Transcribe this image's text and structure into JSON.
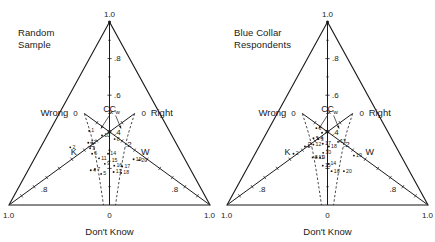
{
  "figure": {
    "type": "ternary-plot-pair",
    "background": "#ffffff",
    "ink": "#1a1a1a"
  },
  "panels": [
    {
      "id": "random-sample",
      "title": "Random\nSample",
      "axes": {
        "apex_label": "1.0",
        "bottom_left_label": "1.0",
        "bottom_right_label": "1.0",
        "bottom_center_label": "0",
        "bottom_axis_name": "Don't Know",
        "left_axis_name": "Wrong",
        "right_axis_name": "Right",
        "left_zero_label": "0",
        "right_zero_label": "0",
        "vertical_ticks": [
          "1.0",
          ".8",
          ".6",
          ".4"
        ],
        "left_inner_tick": ".2",
        "right_inner_tick": ".2",
        "left_outer_tick": ".8",
        "right_outer_tick": ".8"
      },
      "region_labels": [
        {
          "text": "K",
          "x": 0.255,
          "y": 0.725
        },
        {
          "text": "W",
          "x": 0.745,
          "y": 0.725
        }
      ],
      "boundary_labels": [
        {
          "text": "C",
          "sub": "k"
        },
        {
          "text": "C",
          "sub": "w"
        }
      ],
      "points": [
        {
          "id": "1",
          "x": 0.33,
          "y": 0.595
        },
        {
          "id": "2",
          "x": 0.215,
          "y": 0.685
        },
        {
          "id": "3",
          "x": 0.36,
          "y": 0.69
        },
        {
          "id": "4",
          "x": 0.385,
          "y": 0.81
        },
        {
          "id": "5",
          "x": 0.45,
          "y": 0.83
        },
        {
          "id": "6",
          "x": 0.38,
          "y": 0.72
        },
        {
          "id": "7",
          "x": 0.41,
          "y": 0.805
        },
        {
          "id": "8",
          "x": 0.54,
          "y": 0.64
        },
        {
          "id": "9",
          "x": 0.47,
          "y": 0.775
        },
        {
          "id": "10",
          "x": 0.44,
          "y": 0.62
        },
        {
          "id": "11",
          "x": 0.43,
          "y": 0.745
        },
        {
          "id": "12",
          "x": 0.34,
          "y": 0.66
        },
        {
          "id": "13",
          "x": 0.525,
          "y": 0.82
        },
        {
          "id": "14",
          "x": 0.49,
          "y": 0.72
        },
        {
          "id": "15",
          "x": 0.5,
          "y": 0.76
        },
        {
          "id": "16",
          "x": 0.53,
          "y": 0.785
        },
        {
          "id": "17",
          "x": 0.58,
          "y": 0.79
        },
        {
          "id": "18",
          "x": 0.57,
          "y": 0.825
        },
        {
          "id": "19",
          "x": 0.66,
          "y": 0.75
        },
        {
          "id": "20",
          "x": 0.695,
          "y": 0.755
        }
      ]
    },
    {
      "id": "blue-collar-respondents",
      "title": "Blue Collar\nRespondents",
      "axes": {
        "apex_label": "1.0",
        "bottom_left_label": "1.0",
        "bottom_right_label": "1.0",
        "bottom_center_label": "0",
        "bottom_axis_name": "Don't Know",
        "left_axis_name": "Wrong",
        "right_axis_name": "Right",
        "left_zero_label": "0",
        "right_zero_label": "0",
        "vertical_ticks": [
          "1.0",
          ".8",
          ".6",
          ".4"
        ],
        "left_inner_tick": ".2",
        "right_inner_tick": ".2",
        "left_outer_tick": ".8",
        "right_outer_tick": ".8"
      },
      "region_labels": [
        {
          "text": "K",
          "x": 0.225,
          "y": 0.725
        },
        {
          "text": "W",
          "x": 0.79,
          "y": 0.725
        }
      ],
      "boundary_labels": [
        {
          "text": "C",
          "sub": "k"
        },
        {
          "text": "C",
          "sub": "w"
        }
      ],
      "points": [
        {
          "id": "1",
          "x": 0.335,
          "y": 0.68
        },
        {
          "id": "2",
          "x": 0.265,
          "y": 0.72
        },
        {
          "id": "3",
          "x": 0.43,
          "y": 0.64
        },
        {
          "id": "4",
          "x": 0.425,
          "y": 0.635
        },
        {
          "id": "5",
          "x": 0.39,
          "y": 0.635
        },
        {
          "id": "6",
          "x": 0.405,
          "y": 0.58
        },
        {
          "id": "7",
          "x": 0.455,
          "y": 0.605
        },
        {
          "id": "8",
          "x": 0.4,
          "y": 0.74
        },
        {
          "id": "9",
          "x": 0.45,
          "y": 0.74
        },
        {
          "id": "10",
          "x": 0.47,
          "y": 0.715
        },
        {
          "id": "11",
          "x": 0.425,
          "y": 0.74
        },
        {
          "id": "12",
          "x": 0.395,
          "y": 0.67
        },
        {
          "id": "13",
          "x": 0.58,
          "y": 0.655
        },
        {
          "id": "14",
          "x": 0.505,
          "y": 0.775
        },
        {
          "id": "15",
          "x": 0.47,
          "y": 0.785
        },
        {
          "id": "16",
          "x": 0.525,
          "y": 0.815
        },
        {
          "id": "17",
          "x": 0.465,
          "y": 0.665
        },
        {
          "id": "18",
          "x": 0.51,
          "y": 0.68
        },
        {
          "id": "19",
          "x": 0.68,
          "y": 0.73
        },
        {
          "id": "20",
          "x": 0.6,
          "y": 0.815
        }
      ]
    }
  ],
  "chart_data": {
    "type": "scatter",
    "subplots": [
      {
        "name": "Random Sample",
        "axes": [
          "Wrong",
          "Right",
          "Don't Know"
        ],
        "axis_ranges": [
          [
            0,
            1.0
          ],
          [
            0,
            1.0
          ],
          [
            0,
            1.0
          ]
        ],
        "tick_labels_vertical": [
          "1.0",
          ".8",
          ".6",
          ".4"
        ],
        "tick_labels_edges": [
          "0",
          ".2",
          ".8",
          "1.0"
        ],
        "grid": false,
        "legend": "none",
        "regions": [
          "K",
          "W"
        ],
        "region_boundaries": [
          "Ck",
          "Cw"
        ],
        "n_points": 20,
        "point_labels": [
          "1",
          "2",
          "3",
          "4",
          "5",
          "6",
          "7",
          "8",
          "9",
          "10",
          "11",
          "12",
          "13",
          "14",
          "15",
          "16",
          "17",
          "18",
          "19",
          "20"
        ]
      },
      {
        "name": "Blue Collar Respondents",
        "axes": [
          "Wrong",
          "Right",
          "Don't Know"
        ],
        "axis_ranges": [
          [
            0,
            1.0
          ],
          [
            0,
            1.0
          ],
          [
            0,
            1.0
          ]
        ],
        "tick_labels_vertical": [
          "1.0",
          ".8",
          ".6",
          ".4"
        ],
        "tick_labels_edges": [
          "0",
          ".2",
          ".8",
          "1.0"
        ],
        "grid": false,
        "legend": "none",
        "regions": [
          "K",
          "W"
        ],
        "region_boundaries": [
          "Ck",
          "Cw"
        ],
        "n_points": 20,
        "point_labels": [
          "1",
          "2",
          "3",
          "4",
          "5",
          "6",
          "7",
          "8",
          "9",
          "10",
          "11",
          "12",
          "13",
          "14",
          "15",
          "16",
          "17",
          "18",
          "19",
          "20"
        ]
      }
    ]
  }
}
